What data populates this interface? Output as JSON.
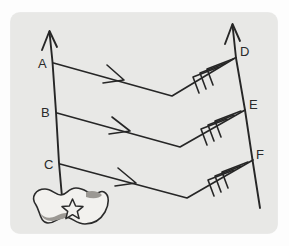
{
  "figure": {
    "background_color": "#fdfdfd",
    "panel_color": "#e8e8e6",
    "ink_color": "#262626",
    "island_fill": "#f2f1ee",
    "island_shade": "#9b9893"
  },
  "labels": {
    "a": "A",
    "b": "B",
    "c": "C",
    "d": "D",
    "e": "E",
    "f": "F"
  },
  "axes": [
    {
      "name": "left-axis",
      "arrow_direction": "up",
      "points": [
        "A",
        "B",
        "C"
      ]
    },
    {
      "name": "right-axis",
      "arrow_direction": "up",
      "points": [
        "D",
        "E",
        "F"
      ]
    }
  ],
  "paths": [
    {
      "name": "path-a-to-d",
      "from": "A",
      "to": "D",
      "mid_arrow": "single",
      "end_barbs": 3
    },
    {
      "name": "path-b-to-e",
      "from": "B",
      "to": "E",
      "mid_arrow": "single",
      "end_barbs": 3
    },
    {
      "name": "path-c-to-f",
      "from": "C",
      "to": "F",
      "mid_arrow": "single",
      "end_barbs": 3
    }
  ],
  "island": {
    "name": "island",
    "marker": "star",
    "marker_name": "capital-star-marker"
  }
}
